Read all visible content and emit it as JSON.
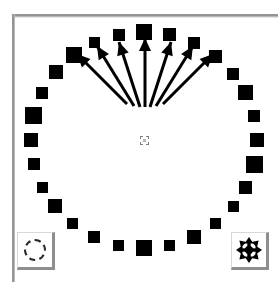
{
  "window": {
    "title": "Particle Ring Canvas",
    "background_color": "#ffffff",
    "frame_color": "#8e8e8e"
  },
  "canvas": {
    "name": "simulation-canvas",
    "width": 263,
    "height": 264,
    "background_color": "#ffffff",
    "shape_color": "#000000",
    "center_marker": {
      "label": "selection-handle",
      "x": 129,
      "y": 122,
      "size": 9,
      "style": "dashed",
      "color": "#808080"
    },
    "ring": {
      "label": "ring-of-squares",
      "count": 28,
      "center_x": 129,
      "center_y": 122,
      "radius_x": 113,
      "radius_y": 108,
      "squares": [
        {
          "index": 0,
          "angle_deg": -90,
          "size": 16
        },
        {
          "index": 1,
          "angle_deg": -77,
          "size": 13
        },
        {
          "index": 2,
          "angle_deg": -64,
          "size": 12
        },
        {
          "index": 3,
          "angle_deg": -51,
          "size": 13
        },
        {
          "index": 4,
          "angle_deg": -38,
          "size": 12
        },
        {
          "index": 5,
          "angle_deg": -26,
          "size": 15
        },
        {
          "index": 6,
          "angle_deg": -13,
          "size": 12
        },
        {
          "index": 7,
          "angle_deg": 0,
          "size": 14
        },
        {
          "index": 8,
          "angle_deg": 13,
          "size": 17
        },
        {
          "index": 9,
          "angle_deg": 26,
          "size": 13
        },
        {
          "index": 10,
          "angle_deg": 38,
          "size": 11
        },
        {
          "index": 11,
          "angle_deg": 51,
          "size": 11
        },
        {
          "index": 12,
          "angle_deg": 64,
          "size": 14
        },
        {
          "index": 13,
          "angle_deg": 77,
          "size": 11
        },
        {
          "index": 14,
          "angle_deg": 90,
          "size": 16
        },
        {
          "index": 15,
          "angle_deg": 103,
          "size": 11
        },
        {
          "index": 16,
          "angle_deg": 116,
          "size": 12
        },
        {
          "index": 17,
          "angle_deg": 129,
          "size": 11
        },
        {
          "index": 18,
          "angle_deg": 142,
          "size": 14
        },
        {
          "index": 19,
          "angle_deg": 154,
          "size": 11
        },
        {
          "index": 20,
          "angle_deg": 167,
          "size": 12
        },
        {
          "index": 21,
          "angle_deg": 180,
          "size": 14
        },
        {
          "index": 22,
          "angle_deg": 193,
          "size": 17
        },
        {
          "index": 23,
          "angle_deg": 206,
          "size": 12
        },
        {
          "index": 24,
          "angle_deg": 219,
          "size": 14
        },
        {
          "index": 25,
          "angle_deg": 232,
          "size": 16
        },
        {
          "index": 26,
          "angle_deg": 244,
          "size": 11
        },
        {
          "index": 27,
          "angle_deg": 257,
          "size": 12
        },
        {
          "index": 28,
          "angle_deg": 270,
          "size": 13
        },
        {
          "index": 29,
          "angle_deg": 283,
          "size": 11
        },
        {
          "index": 30,
          "angle_deg": 296,
          "size": 12
        },
        {
          "index": 31,
          "angle_deg": 309,
          "size": 12
        }
      ]
    },
    "arrow_fan": {
      "label": "vector-field-arrows",
      "count": 7,
      "color": "#000000",
      "origin_x": 129,
      "origin_y": 100,
      "arrows": [
        {
          "index": 0,
          "x1": 112,
          "y1": 86,
          "x2": 62,
          "y2": 36,
          "angle_deg": -135
        },
        {
          "index": 1,
          "x1": 119,
          "y1": 88,
          "x2": 82,
          "y2": 28,
          "angle_deg": -122
        },
        {
          "index": 2,
          "x1": 125,
          "y1": 89,
          "x2": 104,
          "y2": 24,
          "angle_deg": -108
        },
        {
          "index": 3,
          "x1": 130,
          "y1": 89,
          "x2": 130,
          "y2": 20,
          "angle_deg": -90
        },
        {
          "index": 4,
          "x1": 135,
          "y1": 89,
          "x2": 156,
          "y2": 24,
          "angle_deg": -72
        },
        {
          "index": 5,
          "x1": 141,
          "y1": 88,
          "x2": 178,
          "y2": 28,
          "angle_deg": -58
        },
        {
          "index": 6,
          "x1": 148,
          "y1": 86,
          "x2": 198,
          "y2": 36,
          "angle_deg": -45
        }
      ]
    }
  },
  "toolbar": {
    "select_tool": {
      "name": "select-tool-button",
      "icon": "dashed-circle-icon",
      "tooltip": "Select",
      "pressed": false
    },
    "move_tool": {
      "name": "move-tool-button",
      "icon": "move-cross-arrows-icon",
      "tooltip": "Move",
      "pressed": false
    }
  }
}
